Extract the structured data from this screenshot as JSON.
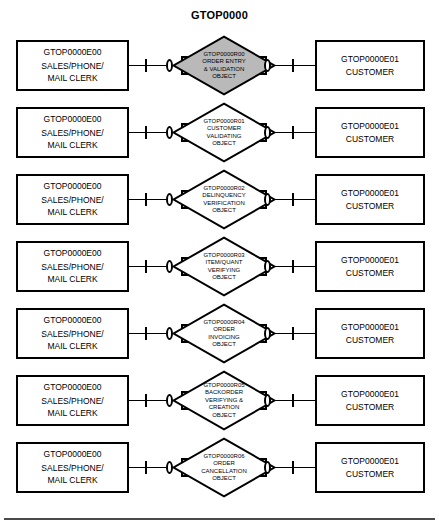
{
  "diagram": {
    "title": "GTOP0000",
    "shaded_fill": "#b9b9b9",
    "line_color": "#000000",
    "background": "#ffffff"
  },
  "cardinality": {
    "one_symbol": "one-tick",
    "zero_symbol": "zero-oval"
  },
  "rows": [
    {
      "left_entity": {
        "code": "GTOP0000E00",
        "line1": "SALES/PHONE/",
        "line2": "MAIL CLERK"
      },
      "relationship": {
        "code": "GTOP0000R00",
        "lines": [
          "ORDER ENTRY",
          "& VALIDATION",
          "OBJECT"
        ],
        "shaded": true
      },
      "right_entity": {
        "code": "GTOP0000E01",
        "line1": "CUSTOMER",
        "line2": ""
      }
    },
    {
      "left_entity": {
        "code": "GTOP0000E00",
        "line1": "SALES/PHONE/",
        "line2": "MAIL CLERK"
      },
      "relationship": {
        "code": "GTOP0000R01",
        "lines": [
          "CUSTOMER",
          "VALIDATING",
          "OBJECT"
        ],
        "shaded": false
      },
      "right_entity": {
        "code": "GTOP0000E01",
        "line1": "CUSTOMER",
        "line2": ""
      }
    },
    {
      "left_entity": {
        "code": "GTOP0000E00",
        "line1": "SALES/PHONE/",
        "line2": "MAIL CLERK"
      },
      "relationship": {
        "code": "GTOP0000R02",
        "lines": [
          "DELINQUENCY",
          "VERIFICATION",
          "OBJECT"
        ],
        "shaded": false
      },
      "right_entity": {
        "code": "GTOP0000E01",
        "line1": "CUSTOMER",
        "line2": ""
      }
    },
    {
      "left_entity": {
        "code": "GTOP0000E00",
        "line1": "SALES/PHONE/",
        "line2": "MAIL CLERK"
      },
      "relationship": {
        "code": "GTOP0000R03",
        "lines": [
          "ITEM/QUANT",
          "VERIFYING",
          "OBJECT"
        ],
        "shaded": false
      },
      "right_entity": {
        "code": "GTOP0000E01",
        "line1": "CUSTOMER",
        "line2": ""
      }
    },
    {
      "left_entity": {
        "code": "GTOP0000E00",
        "line1": "SALES/PHONE/",
        "line2": "MAIL CLERK"
      },
      "relationship": {
        "code": "GTOP0000R04",
        "lines": [
          "ORDER",
          "INVOICING",
          "OBJECT"
        ],
        "shaded": false
      },
      "right_entity": {
        "code": "GTOP0000E01",
        "line1": "CUSTOMER",
        "line2": ""
      }
    },
    {
      "left_entity": {
        "code": "GTOP0000E00",
        "line1": "SALES/PHONE/",
        "line2": "MAIL CLERK"
      },
      "relationship": {
        "code": "GTOP0000R05",
        "lines": [
          "BACKORDER",
          "VERIFYING &",
          "CREATION",
          "OBJECT"
        ],
        "shaded": false
      },
      "right_entity": {
        "code": "GTOP0000E01",
        "line1": "CUSTOMER",
        "line2": ""
      }
    },
    {
      "left_entity": {
        "code": "GTOP0000E00",
        "line1": "SALES/PHONE/",
        "line2": "MAIL CLERK"
      },
      "relationship": {
        "code": "GTOP0000R06",
        "lines": [
          "ORDER",
          "CANCELLATION",
          "OBJECT"
        ],
        "shaded": false
      },
      "right_entity": {
        "code": "GTOP0000E01",
        "line1": "CUSTOMER",
        "line2": ""
      }
    }
  ]
}
